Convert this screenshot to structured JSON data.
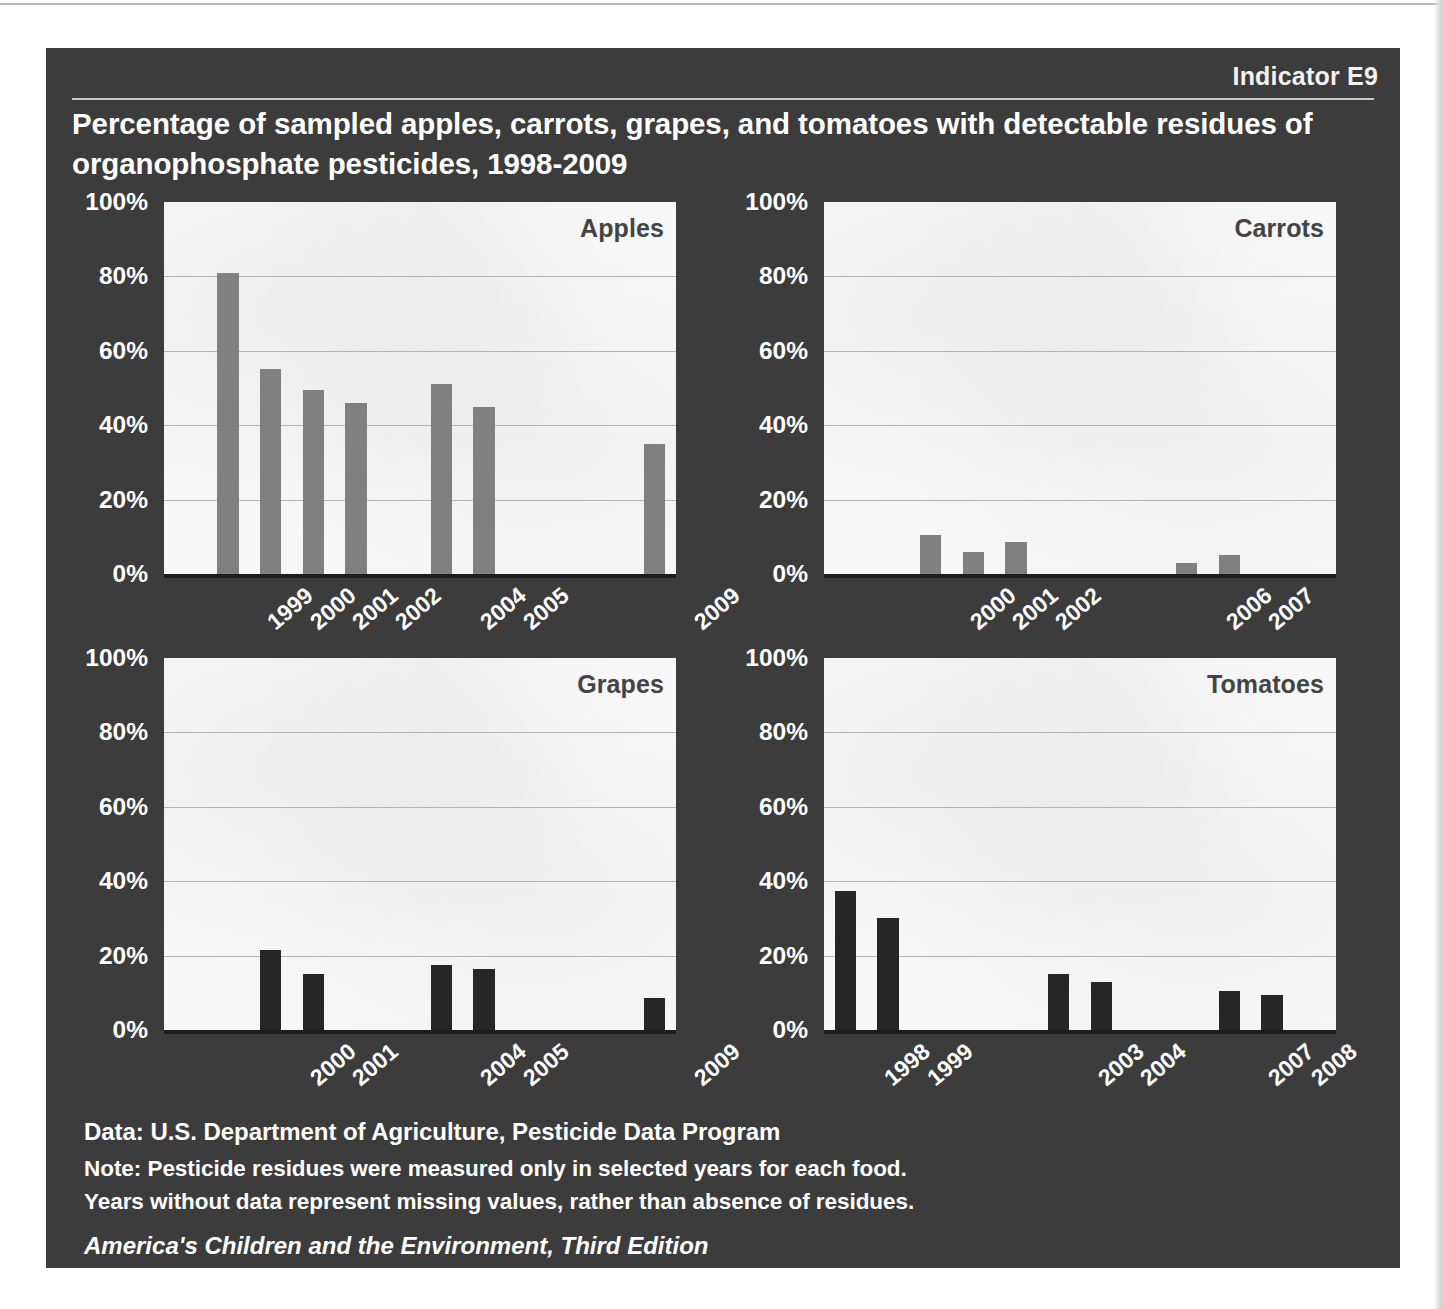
{
  "header": {
    "indicator": "Indicator E9",
    "title": "Percentage of sampled apples, carrots, grapes, and tomatoes with detectable residues of organophosphate pesticides, 1998-2009"
  },
  "footer": {
    "data_line": "Data: U.S. Department of Agriculture, Pesticide Data Program",
    "note_line_1": "Note: Pesticide residues were measured only in selected years for each food.",
    "note_line_2": "Years without data represent missing values, rather than absence of residues.",
    "series_line": "America's Children and the Environment, Third Edition"
  },
  "colors": {
    "panel_background": "#3b3b3b",
    "plot_background": "#f7f7f7",
    "gridline": "#b3b3b3",
    "axis": "#1d1d1d",
    "bar_light": "#808080",
    "bar_dark": "#262626",
    "text_light": "#ffffff",
    "panel_label": "#444444"
  },
  "chart_data": [
    {
      "type": "bar",
      "title": "Apples",
      "xlabel": "",
      "ylabel": "",
      "ylim": [
        0,
        100
      ],
      "ytick_labels": [
        "100%",
        "80%",
        "60%",
        "40%",
        "20%",
        "0%"
      ],
      "yticks": [
        100,
        80,
        60,
        40,
        20,
        0
      ],
      "grid": true,
      "axis_years": [
        1998,
        1999,
        2000,
        2001,
        2002,
        2003,
        2004,
        2005,
        2006,
        2007,
        2008,
        2009
      ],
      "categories": [
        "1999",
        "2000",
        "2001",
        "2002",
        "2004",
        "2005",
        "2009"
      ],
      "values": [
        81,
        55,
        49.5,
        46,
        51,
        45,
        35
      ],
      "bar_color": "#808080",
      "missing_years": [
        "1998",
        "2003",
        "2006",
        "2007",
        "2008"
      ]
    },
    {
      "type": "bar",
      "title": "Carrots",
      "xlabel": "",
      "ylabel": "",
      "ylim": [
        0,
        100
      ],
      "ytick_labels": [
        "100%",
        "80%",
        "60%",
        "40%",
        "20%",
        "0%"
      ],
      "yticks": [
        100,
        80,
        60,
        40,
        20,
        0
      ],
      "grid": true,
      "axis_years": [
        1998,
        1999,
        2000,
        2001,
        2002,
        2003,
        2004,
        2005,
        2006,
        2007,
        2008,
        2009
      ],
      "categories": [
        "2000",
        "2001",
        "2002",
        "2006",
        "2007"
      ],
      "values": [
        10.5,
        6,
        8.5,
        3,
        5
      ],
      "bar_color": "#808080",
      "missing_years": [
        "1998",
        "1999",
        "2003",
        "2004",
        "2005",
        "2008",
        "2009"
      ]
    },
    {
      "type": "bar",
      "title": "Grapes",
      "xlabel": "",
      "ylabel": "",
      "ylim": [
        0,
        100
      ],
      "ytick_labels": [
        "100%",
        "80%",
        "60%",
        "40%",
        "20%",
        "0%"
      ],
      "yticks": [
        100,
        80,
        60,
        40,
        20,
        0
      ],
      "grid": true,
      "axis_years": [
        1998,
        1999,
        2000,
        2001,
        2002,
        2003,
        2004,
        2005,
        2006,
        2007,
        2008,
        2009
      ],
      "categories": [
        "2000",
        "2001",
        "2004",
        "2005",
        "2009"
      ],
      "values": [
        21.5,
        15,
        17.5,
        16.5,
        8.5
      ],
      "bar_color": "#262626",
      "missing_years": [
        "1998",
        "1999",
        "2002",
        "2003",
        "2006",
        "2007",
        "2008"
      ]
    },
    {
      "type": "bar",
      "title": "Tomatoes",
      "xlabel": "",
      "ylabel": "",
      "ylim": [
        0,
        100
      ],
      "ytick_labels": [
        "100%",
        "80%",
        "60%",
        "40%",
        "20%",
        "0%"
      ],
      "yticks": [
        100,
        80,
        60,
        40,
        20,
        0
      ],
      "grid": true,
      "axis_years": [
        1998,
        1999,
        2000,
        2001,
        2002,
        2003,
        2004,
        2005,
        2006,
        2007,
        2008,
        2009
      ],
      "categories": [
        "1998",
        "1999",
        "2003",
        "2004",
        "2007",
        "2008"
      ],
      "values": [
        37.5,
        30,
        15,
        13,
        10.5,
        9.5
      ],
      "bar_color": "#262626",
      "missing_years": [
        "2000",
        "2001",
        "2002",
        "2005",
        "2006",
        "2009"
      ]
    }
  ]
}
